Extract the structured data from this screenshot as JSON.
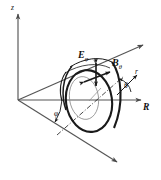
{
  "figure": {
    "kind": "3d-coordinate-diagram",
    "background_color": "#ffffff",
    "ink_color": "#1a1a1a",
    "axis_color": "#555555",
    "width_px": 161,
    "height_px": 180
  },
  "axes": [
    {
      "id": "z",
      "label": "z",
      "style": "italic",
      "direction": "up",
      "tail": [
        18,
        100
      ],
      "head": [
        18,
        12
      ]
    },
    {
      "id": "R",
      "label": "R",
      "style": "italic-bold",
      "direction": "right",
      "tail": [
        18,
        100
      ],
      "head": [
        145,
        100
      ]
    },
    {
      "id": "r",
      "label": "r",
      "style": "italic",
      "direction": "upper-right",
      "tail": [
        118,
        94
      ],
      "head": [
        138,
        74
      ]
    },
    {
      "id": "oblique-up",
      "label": "",
      "style": "plain",
      "direction": "upper-right",
      "tail": [
        18,
        100
      ],
      "head": [
        147,
        42
      ]
    },
    {
      "id": "oblique-down",
      "label": "",
      "style": "plain",
      "direction": "lower-right",
      "tail": [
        18,
        100
      ],
      "head": [
        121,
        166
      ]
    }
  ],
  "angles": [
    {
      "id": "phi",
      "label": "φ",
      "between": [
        "R-axis",
        "oblique-down"
      ],
      "vertex": [
        18,
        100
      ],
      "label_pos": [
        55,
        113
      ]
    },
    {
      "id": "theta",
      "label": "θ",
      "between": [
        "R-axis",
        "r-axis"
      ],
      "vertex": [
        118,
        100
      ],
      "label_pos": [
        124,
        86
      ]
    }
  ],
  "fields": [
    {
      "id": "E-phi",
      "symbol": "E",
      "subscript": "φ",
      "label_text": "E",
      "arrow": "double-headed",
      "orientation": "vertical",
      "label_pos": [
        80,
        54
      ]
    },
    {
      "id": "B-theta",
      "symbol": "B",
      "subscript": "θ",
      "label_text": "B",
      "arrow": "double-headed",
      "orientation": "diagonal",
      "label_pos": [
        113,
        63
      ]
    }
  ],
  "shapes": [
    {
      "id": "plasma-torus-cross-section",
      "type": "ellipse",
      "center": [
        88,
        101
      ],
      "rx": 23,
      "ry": 31,
      "rotation_deg": -8,
      "stroke_weight": "heavy"
    },
    {
      "id": "inner-flux-surface",
      "type": "ellipse",
      "center": [
        85,
        98
      ],
      "rx": 14,
      "ry": 21,
      "rotation_deg": -8,
      "stroke_weight": "light"
    },
    {
      "id": "poloidal-field-line-front",
      "type": "arc",
      "stroke_weight": "heavy"
    },
    {
      "id": "poloidal-field-line-back",
      "type": "arc",
      "stroke_weight": "medium"
    },
    {
      "id": "magnetic-axis",
      "type": "dash-dot-line",
      "from": [
        60,
        130
      ],
      "to": [
        120,
        78
      ]
    }
  ],
  "caption": ""
}
